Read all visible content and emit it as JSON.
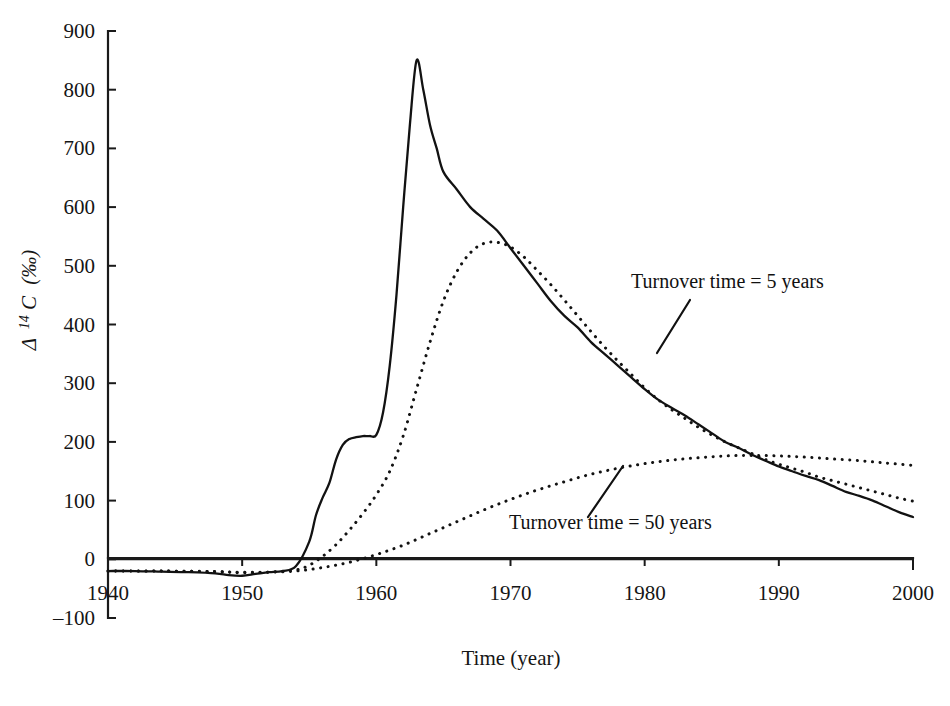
{
  "chart_data": {
    "type": "line",
    "title": "",
    "subtitle": "",
    "xlabel": "Time (year)",
    "ylabel": "Δ 14C (‰)",
    "ylabel_parts": {
      "delta": "Δ",
      "superscript": "14",
      "element": "C",
      "units": "(‰)"
    },
    "xlim": [
      1940,
      2000
    ],
    "ylim": [
      -100,
      900
    ],
    "xticks": [
      1940,
      1950,
      1960,
      1970,
      1980,
      1990,
      2000
    ],
    "xtick_labels": [
      "1940",
      "1950",
      "1960",
      "1970",
      "1980",
      "1990",
      "2000"
    ],
    "yticks": [
      -100,
      0,
      100,
      200,
      300,
      400,
      500,
      600,
      700,
      800,
      900
    ],
    "ytick_labels": [
      "-100",
      "0",
      "100",
      "200",
      "300",
      "400",
      "500",
      "600",
      "700",
      "800",
      "900"
    ],
    "grid": false,
    "legend_position": "inline-annotations",
    "zero_reference_line": true,
    "series": [
      {
        "name": "Atmospheric Δ 14C",
        "style": "solid",
        "color": "#121212",
        "x": [
          1940,
          1942,
          1944,
          1946,
          1948,
          1949,
          1950,
          1951,
          1952,
          1953,
          1954,
          1955,
          1955.5,
          1956,
          1956.5,
          1957,
          1957.5,
          1958,
          1958.5,
          1959,
          1959.5,
          1960,
          1960.5,
          1961,
          1961.5,
          1962,
          1962.5,
          1963,
          1963.5,
          1964,
          1964.5,
          1965,
          1966,
          1967,
          1968,
          1969,
          1970,
          1971,
          1972,
          1973,
          1974,
          1975,
          1976,
          1977,
          1978,
          1979,
          1980,
          1981,
          1982,
          1983,
          1984,
          1985,
          1986,
          1987,
          1988,
          1989,
          1990,
          1991,
          1992,
          1993,
          1994,
          1995,
          1996,
          1997,
          1998,
          1999,
          2000
        ],
        "y": [
          -20,
          -20,
          -21,
          -22,
          -24,
          -27,
          -28,
          -25,
          -22,
          -20,
          -12,
          30,
          75,
          105,
          130,
          170,
          195,
          205,
          208,
          210,
          210,
          212,
          250,
          330,
          450,
          600,
          740,
          850,
          800,
          740,
          700,
          660,
          630,
          600,
          580,
          560,
          530,
          500,
          470,
          440,
          415,
          395,
          370,
          350,
          330,
          310,
          290,
          272,
          258,
          245,
          230,
          215,
          200,
          190,
          178,
          168,
          158,
          150,
          142,
          135,
          125,
          115,
          108,
          100,
          90,
          80,
          72
        ]
      },
      {
        "name": "Turnover time = 5 years",
        "style": "dotted",
        "color": "#121212",
        "x": [
          1940,
          1944,
          1948,
          1950,
          1952,
          1954,
          1955,
          1956,
          1957,
          1958,
          1959,
          1960,
          1961,
          1962,
          1963,
          1964,
          1965,
          1966,
          1967,
          1968,
          1969,
          1970,
          1971,
          1972,
          1973,
          1974,
          1975,
          1976,
          1977,
          1978,
          1979,
          1980,
          1981,
          1982,
          1983,
          1984,
          1985,
          1986,
          1987,
          1988,
          1989,
          1990,
          1991,
          1992,
          1993,
          1994,
          1995,
          1996,
          1997,
          1998,
          1999,
          2000
        ],
        "y": [
          -20,
          -20,
          -21,
          -23,
          -22,
          -18,
          -10,
          5,
          25,
          50,
          78,
          110,
          150,
          210,
          290,
          370,
          440,
          490,
          522,
          538,
          540,
          532,
          515,
          492,
          468,
          442,
          415,
          388,
          362,
          338,
          315,
          292,
          272,
          255,
          240,
          225,
          212,
          200,
          190,
          180,
          170,
          162,
          155,
          148,
          140,
          134,
          128,
          122,
          116,
          110,
          104,
          99
        ]
      },
      {
        "name": "Turnover time = 50 years",
        "style": "dotted",
        "color": "#121212",
        "x": [
          1940,
          1944,
          1948,
          1950,
          1952,
          1954,
          1956,
          1958,
          1960,
          1962,
          1964,
          1966,
          1968,
          1970,
          1972,
          1974,
          1976,
          1978,
          1980,
          1982,
          1984,
          1986,
          1988,
          1990,
          1992,
          1994,
          1996,
          1998,
          2000
        ],
        "y": [
          -20,
          -20,
          -21,
          -22,
          -22,
          -20,
          -14,
          -5,
          8,
          24,
          44,
          64,
          84,
          102,
          118,
          132,
          145,
          155,
          163,
          169,
          173,
          176,
          177,
          176,
          174,
          171,
          168,
          164,
          160
        ]
      }
    ],
    "annotations": [
      {
        "text": "Turnover time = 5 years",
        "text_x": 631,
        "text_y": 288,
        "leader": {
          "x1": 690,
          "y1": 300,
          "x2": 657,
          "y2": 353
        }
      },
      {
        "text": "Turnover time = 50 years",
        "text_x": 509,
        "text_y": 529,
        "leader": {
          "x1": 588,
          "y1": 517,
          "x2": 623,
          "y2": 466
        }
      }
    ]
  },
  "geometry": {
    "plot_left": 108,
    "plot_right": 913,
    "plot_top": 31,
    "plot_bottom": 618,
    "y_at_zero": 560,
    "axis_baseline_y": 558,
    "tick_length": 8
  }
}
